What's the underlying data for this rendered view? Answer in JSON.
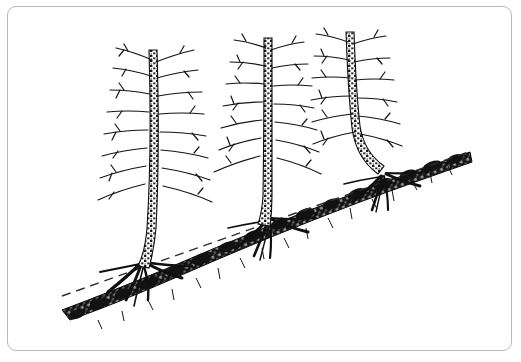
{
  "figure": {
    "medium": "pen-and-ink line drawing",
    "background_color": "#ffffff",
    "ink_color": "#1a1a1a",
    "frame": {
      "name": "figure-border",
      "color": "#b9b9b9",
      "style": "thin rounded rectangle",
      "corner_radius": 9,
      "x": 7,
      "y": 6,
      "width": 505,
      "height": 345
    },
    "canvas": {
      "width": 521,
      "height": 362
    },
    "labels": [],
    "caption": ""
  },
  "slope": {
    "name": "ground-surface",
    "description": "Dark stippled soil band descending from upper right to lower left",
    "direction": "descends right to left",
    "color": "#141414",
    "upper_end": {
      "x": 470,
      "y": 158
    },
    "lower_end": {
      "x": 66,
      "y": 318
    },
    "band_thickness": 16
  },
  "reference_line": {
    "name": "original-slope-reference-line",
    "description": "Dashed straight line marking the original undisturbed ground plane",
    "style": "dashed",
    "dash_pattern": "9 6",
    "color": "#333333",
    "width": 1.4,
    "start": {
      "x": 62,
      "y": 296
    },
    "end": {
      "x": 468,
      "y": 152
    }
  },
  "trees": [
    {
      "id": "tree-1",
      "name": "tree-left",
      "position": "left",
      "trunk_base": {
        "x": 140,
        "y": 278
      },
      "trunk_top": {
        "x": 155,
        "y": 48
      },
      "curvature": "gentle basal sweep",
      "curvature_degree": "slight",
      "root_flare": "exposed spreading roots",
      "branch_count": 13,
      "foliage": "bare branches"
    },
    {
      "id": "tree-2",
      "name": "tree-middle",
      "position": "middle",
      "trunk_base": {
        "x": 268,
        "y": 233
      },
      "trunk_top": {
        "x": 268,
        "y": 35
      },
      "curvature": "near vertical with small basal bend",
      "curvature_degree": "moderate",
      "root_flare": "exposed spreading roots",
      "branch_count": 12,
      "foliage": "bare branches"
    },
    {
      "id": "tree-3",
      "name": "tree-right",
      "position": "right",
      "trunk_base": {
        "x": 383,
        "y": 186
      },
      "trunk_top": {
        "x": 350,
        "y": 30
      },
      "curvature": "pronounced pistol-butt curve at base",
      "curvature_degree": "strong",
      "root_flare": "exposed spreading roots",
      "branch_count": 12,
      "foliage": "bare branches"
    }
  ]
}
